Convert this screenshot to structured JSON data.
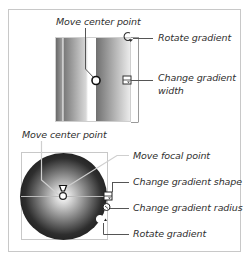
{
  "linear_gradient_diagram": {
    "labels": {
      "move_center_point": "Move center point",
      "rotate_gradient": "Rotate gradient",
      "change_gradient_width_line1": "Change gradient",
      "change_gradient_width_line2": "width"
    }
  },
  "radial_gradient_diagram": {
    "labels": {
      "move_center_point": "Move center point",
      "move_focal_point": "Move focal point",
      "change_gradient_shape": "Change gradient shape",
      "change_gradient_radius": "Change gradient radius",
      "rotate_gradient": "Rotate gradient"
    }
  },
  "colors": {
    "text": "#2f2f2f",
    "leader_line": "#555555",
    "frame_border": "#c8c8c8"
  }
}
